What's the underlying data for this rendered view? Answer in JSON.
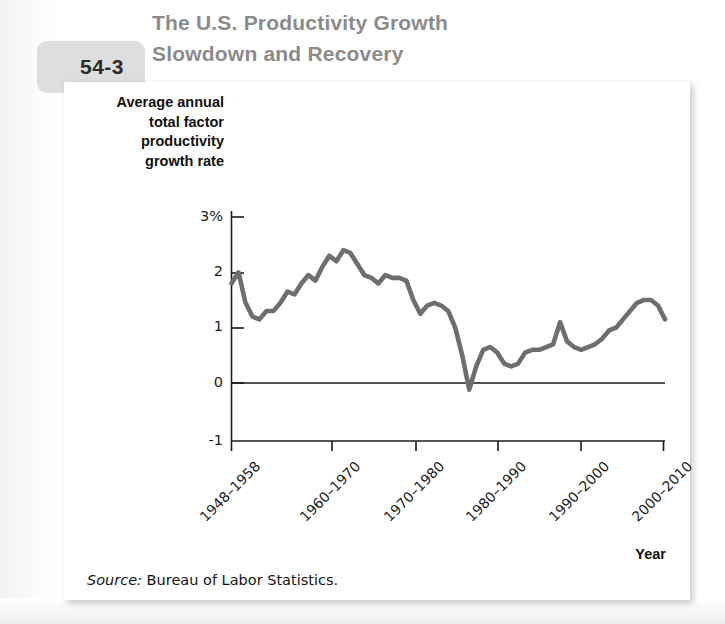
{
  "figure": {
    "label_word": "FIGURE",
    "number": "54-3",
    "title": "The U.S. Productivity Growth Slowdown and Recovery",
    "title_line1": "The U.S. Productivity Growth",
    "title_line2": "Slowdown and Recovery"
  },
  "axes": {
    "y_title_line1": "Average annual",
    "y_title_line2": "total factor",
    "y_title_line3": "productivity",
    "y_title_line4": "growth rate",
    "x_title": "Year"
  },
  "source": {
    "label": "Source:",
    "text": " Bureau of Labor Statistics."
  },
  "colors": {
    "line": "#6e6e6e",
    "axis": "#1b1b1b",
    "title": "#8b8b8b",
    "tab": "#dededd",
    "figure_word": "#c9c9c8",
    "card": "#ffffff"
  },
  "chart_data": {
    "type": "line",
    "title": "The U.S. Productivity Growth Slowdown and Recovery",
    "xlabel": "Year",
    "ylabel": "Average annual total factor productivity growth rate",
    "ylim": [
      -1,
      3
    ],
    "yticks": [
      3,
      2,
      1,
      0,
      -1
    ],
    "ytick_labels": [
      "3%",
      "2",
      "1",
      "0",
      "-1"
    ],
    "xlim": [
      1948,
      2010
    ],
    "xticks": [
      1948,
      1960,
      1970,
      1980,
      1990,
      2000
    ],
    "xtick_labels": [
      "1948–1958",
      "1960–1970",
      "1970–1980",
      "1980–1990",
      "1990–2000",
      "2000–2010"
    ],
    "grid": false,
    "legend": null,
    "zero_line": true,
    "series": [
      {
        "name": "Average annual total factor productivity growth rate",
        "color": "#6e6e6e",
        "x": [
          1948,
          1949,
          1950,
          1951,
          1952,
          1953,
          1954,
          1955,
          1956,
          1957,
          1958,
          1959,
          1960,
          1961,
          1962,
          1963,
          1964,
          1965,
          1966,
          1967,
          1968,
          1969,
          1970,
          1971,
          1972,
          1973,
          1974,
          1975,
          1976,
          1977,
          1978,
          1979,
          1980,
          1981,
          1982,
          1983,
          1984,
          1985,
          1986,
          1987,
          1988,
          1989,
          1990,
          1991,
          1992,
          1993,
          1994,
          1995,
          1996,
          1997,
          1998,
          1999,
          2000,
          2001,
          2002,
          2003,
          2004,
          2005,
          2006,
          2007,
          2008,
          2009,
          2010
        ],
        "y": [
          1.8,
          2.0,
          1.45,
          1.2,
          1.15,
          1.3,
          1.3,
          1.45,
          1.65,
          1.6,
          1.8,
          1.95,
          1.85,
          2.1,
          2.3,
          2.2,
          2.4,
          2.35,
          2.15,
          1.95,
          1.9,
          1.8,
          1.95,
          1.9,
          1.9,
          1.85,
          1.5,
          1.25,
          1.4,
          1.45,
          1.4,
          1.3,
          1.0,
          0.5,
          -0.12,
          0.3,
          0.6,
          0.65,
          0.55,
          0.35,
          0.3,
          0.35,
          0.55,
          0.6,
          0.6,
          0.65,
          0.7,
          1.1,
          0.75,
          0.65,
          0.6,
          0.65,
          0.7,
          0.8,
          0.95,
          1.0,
          1.15,
          1.3,
          1.45,
          1.5,
          1.5,
          1.4,
          1.15
        ],
        "min": -0.12,
        "max": 2.4,
        "start": 1.8,
        "end": 1.15
      }
    ]
  }
}
